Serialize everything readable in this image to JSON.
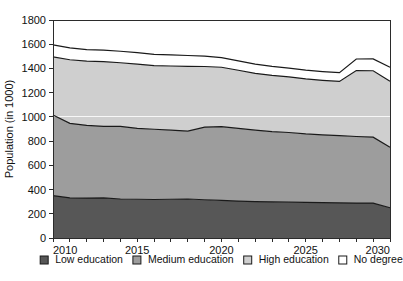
{
  "chart_data": {
    "type": "area",
    "stacked": true,
    "title": "",
    "xlabel": "",
    "ylabel": "Population (in 1000)",
    "xlim": [
      2010,
      2030
    ],
    "ylim": [
      0,
      1800
    ],
    "ytick_step": 200,
    "yticks": [
      0,
      200,
      400,
      600,
      800,
      1000,
      1200,
      1400,
      1600,
      1800
    ],
    "ytick_labels": [
      "0",
      "200",
      "400",
      "600",
      "800",
      "1000",
      "1200",
      "1400",
      "1600",
      "1800"
    ],
    "xticks": [
      2010,
      2011,
      2012,
      2013,
      2014,
      2015,
      2016,
      2017,
      2018,
      2019,
      2020,
      2021,
      2022,
      2023,
      2024,
      2025,
      2026,
      2027,
      2028,
      2029,
      2030
    ],
    "xtick_labels_shown": [
      "2010",
      "2015",
      "2020",
      "2025",
      "2030"
    ],
    "xtick_labels_shown_values": [
      2010,
      2015,
      2020,
      2025,
      2030
    ],
    "grid": "horizontal-white-1000",
    "gridline_values": [
      1000
    ],
    "legend_position": "bottom",
    "x": [
      2010,
      2011,
      2012,
      2013,
      2014,
      2015,
      2016,
      2017,
      2018,
      2019,
      2020,
      2021,
      2022,
      2023,
      2024,
      2025,
      2026,
      2027,
      2028,
      2029,
      2030
    ],
    "series": [
      {
        "name": "Low education",
        "color": "#575757",
        "values": [
          350,
          332,
          330,
          332,
          322,
          320,
          318,
          320,
          322,
          316,
          310,
          305,
          300,
          298,
          296,
          294,
          292,
          290,
          288,
          288,
          250
        ]
      },
      {
        "name": "Medium education",
        "color": "#9d9d9d",
        "values": [
          665,
          615,
          600,
          590,
          600,
          585,
          580,
          570,
          560,
          600,
          610,
          600,
          590,
          580,
          575,
          565,
          560,
          555,
          550,
          545,
          500
        ]
      },
      {
        "name": "High education",
        "color": "#cfcfcf",
        "values": [
          480,
          525,
          530,
          535,
          525,
          530,
          525,
          530,
          535,
          500,
          490,
          480,
          470,
          465,
          460,
          455,
          450,
          448,
          545,
          548,
          545
        ]
      },
      {
        "name": "No degree",
        "color": "#ffffff",
        "values": [
          100,
          98,
          95,
          95,
          95,
          95,
          93,
          92,
          90,
          85,
          80,
          78,
          76,
          74,
          72,
          72,
          72,
          72,
          95,
          98,
          115
        ]
      }
    ],
    "totals": [
      1595,
      1570,
      1555,
      1552,
      1542,
      1530,
      1516,
      1512,
      1507,
      1501,
      1490,
      1463,
      1436,
      1417,
      1403,
      1386,
      1374,
      1365,
      1478,
      1479,
      1410
    ]
  },
  "legend": {
    "items": [
      {
        "label": "Low education",
        "color": "#575757"
      },
      {
        "label": "Medium education",
        "color": "#9d9d9d"
      },
      {
        "label": "High education",
        "color": "#cfcfcf"
      },
      {
        "label": "No degree",
        "color": "#ffffff"
      }
    ]
  },
  "colors": {
    "low": "#575757",
    "medium": "#9d9d9d",
    "high": "#cfcfcf",
    "nodegree": "#ffffff",
    "axis": "#2b2b2b",
    "text": "#111111",
    "edge": "#1a1a1a",
    "background": "#ffffff"
  }
}
